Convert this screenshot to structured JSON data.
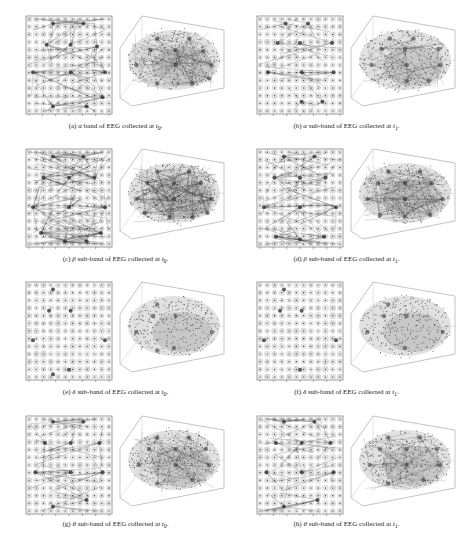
{
  "figure": {
    "panels": [
      {
        "id": "a",
        "label": "(a)",
        "band_symbol": "α",
        "text": "band of EEG collected at",
        "time": "t",
        "time_sub": "0",
        "caption": "(a) α band of EEG collected at t0.",
        "line_density": 0.55,
        "hubs": [
          [
            0.3,
            0.05
          ],
          [
            0.68,
            0.05
          ],
          [
            0.22,
            0.28
          ],
          [
            0.52,
            0.28
          ],
          [
            0.85,
            0.3
          ],
          [
            0.05,
            0.58
          ],
          [
            0.52,
            0.58
          ],
          [
            0.95,
            0.58
          ],
          [
            0.3,
            0.95
          ],
          [
            0.72,
            0.95
          ],
          [
            0.92,
            0.85
          ]
        ]
      },
      {
        "id": "b",
        "label": "(b)",
        "band_symbol": "α",
        "text": "sub-band of EEG collected at",
        "time": "t",
        "time_sub": "1",
        "caption": "(b) α sub-band of EEG collected at t1.",
        "line_density": 0.35,
        "hubs": [
          [
            0.32,
            0.05
          ],
          [
            0.6,
            0.05
          ],
          [
            0.22,
            0.26
          ],
          [
            0.5,
            0.26
          ],
          [
            0.9,
            0.26
          ],
          [
            0.1,
            0.58
          ],
          [
            0.52,
            0.58
          ],
          [
            0.92,
            0.58
          ],
          [
            0.52,
            0.9
          ],
          [
            0.78,
            0.9
          ]
        ]
      },
      {
        "id": "c",
        "label": "(c)",
        "band_symbol": "β",
        "text": "sub-band of EEG collected at",
        "time": "t",
        "time_sub": "0",
        "caption": "(c) β sub-band of EEG collected at t0.",
        "line_density": 1.0,
        "hubs": [
          [
            0.3,
            0.05
          ],
          [
            0.68,
            0.05
          ],
          [
            0.18,
            0.28
          ],
          [
            0.5,
            0.28
          ],
          [
            0.82,
            0.28
          ],
          [
            0.05,
            0.6
          ],
          [
            0.5,
            0.6
          ],
          [
            0.95,
            0.6
          ],
          [
            0.15,
            0.88
          ],
          [
            0.45,
            0.97
          ],
          [
            0.72,
            0.97
          ],
          [
            0.9,
            0.88
          ]
        ]
      },
      {
        "id": "d",
        "label": "(d)",
        "band_symbol": "β",
        "text": "sub-band of EEG collected at",
        "time": "t",
        "time_sub": "1",
        "caption": "(d) β sub-band of EEG collected at t1.",
        "line_density": 0.7,
        "hubs": [
          [
            0.3,
            0.05
          ],
          [
            0.68,
            0.05
          ],
          [
            0.18,
            0.28
          ],
          [
            0.5,
            0.28
          ],
          [
            0.82,
            0.28
          ],
          [
            0.05,
            0.6
          ],
          [
            0.5,
            0.6
          ],
          [
            0.95,
            0.6
          ],
          [
            0.2,
            0.92
          ],
          [
            0.5,
            0.95
          ],
          [
            0.8,
            0.92
          ]
        ]
      },
      {
        "id": "e",
        "label": "(e)",
        "band_symbol": "δ",
        "text": "sub-band of EEG collected at",
        "time": "t",
        "time_sub": "0",
        "caption": "(e) δ sub-band of EEG collected at t0.",
        "line_density": 0.0,
        "hubs": [
          [
            0.3,
            0.05
          ],
          [
            0.25,
            0.28
          ],
          [
            0.52,
            0.28
          ],
          [
            0.05,
            0.6
          ],
          [
            0.95,
            0.6
          ],
          [
            0.5,
            0.92
          ],
          [
            0.3,
            0.97
          ]
        ]
      },
      {
        "id": "f",
        "label": "(f)",
        "band_symbol": "δ",
        "text": "sub-band of EEG collected at",
        "time": "t",
        "time_sub": "1",
        "caption": "(f) δ sub-band of EEG collected at t1.",
        "line_density": 0.0,
        "hubs": [
          [
            0.3,
            0.05
          ],
          [
            0.25,
            0.28
          ],
          [
            0.52,
            0.28
          ],
          [
            0.05,
            0.6
          ],
          [
            0.95,
            0.6
          ],
          [
            0.5,
            0.92
          ]
        ]
      },
      {
        "id": "g",
        "label": "(g)",
        "band_symbol": "θ",
        "text": "sub-band of EEG collected at",
        "time": "t",
        "time_sub": "0",
        "caption": "(g) θ sub-band of EEG collected at t0.",
        "line_density": 0.5,
        "hubs": [
          [
            0.3,
            0.03
          ],
          [
            0.68,
            0.03
          ],
          [
            0.2,
            0.26
          ],
          [
            0.52,
            0.26
          ],
          [
            0.88,
            0.26
          ],
          [
            0.08,
            0.58
          ],
          [
            0.52,
            0.58
          ],
          [
            0.92,
            0.58
          ],
          [
            0.3,
            0.95
          ],
          [
            0.72,
            0.88
          ]
        ]
      },
      {
        "id": "h",
        "label": "(h)",
        "band_symbol": "θ",
        "text": "sub-band of EEG collected at",
        "time": "t",
        "time_sub": "1",
        "caption": "(h) θ sub-band of EEG collected at t1.",
        "line_density": 0.4,
        "hubs": [
          [
            0.3,
            0.03
          ],
          [
            0.68,
            0.03
          ],
          [
            0.2,
            0.26
          ],
          [
            0.52,
            0.26
          ],
          [
            0.88,
            0.26
          ],
          [
            0.08,
            0.58
          ],
          [
            0.52,
            0.58
          ],
          [
            0.92,
            0.58
          ],
          [
            0.3,
            0.95
          ],
          [
            0.72,
            0.88
          ]
        ]
      }
    ],
    "grid": {
      "cols": 12,
      "rows": 13
    },
    "colors": {
      "axis": "#555555",
      "dot_light": "#cfcfcf",
      "dot_dark": "#333333",
      "line": "#222222"
    }
  }
}
